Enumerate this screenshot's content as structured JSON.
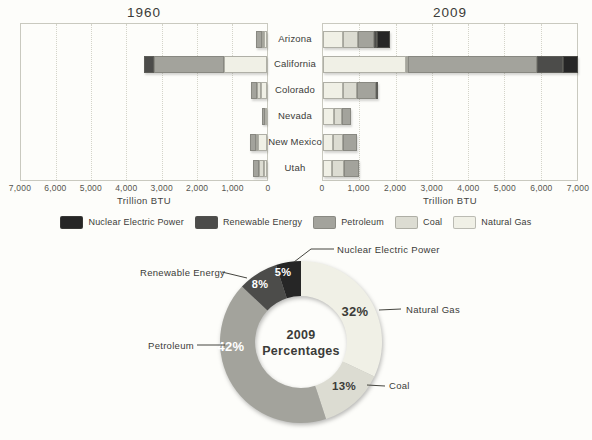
{
  "colors": {
    "Nuclear Electric Power": "#262626",
    "Renewable Energy": "#4c4c4a",
    "Petroleum": "#a3a39c",
    "Coal": "#dcdcd2",
    "Natural Gas": "#f0f0e6"
  },
  "bar_section": {
    "left_title": "1960",
    "right_title": "2009",
    "left_ticks": [
      "7,000",
      "6,000",
      "5,000",
      "4,000",
      "3,000",
      "2,000",
      "1,000",
      "0"
    ],
    "right_ticks": [
      "0",
      "1,000",
      "2,000",
      "3,000",
      "4,000",
      "5,000",
      "6,000",
      "7,000"
    ],
    "axis_label": "Trillion BTU",
    "states": [
      "Arizona",
      "California",
      "Colorado",
      "Nevada",
      "New Mexico",
      "Utah"
    ]
  },
  "legend": {
    "items": [
      {
        "label": "Nuclear Electric Power"
      },
      {
        "label": "Renewable Energy"
      },
      {
        "label": "Petroleum"
      },
      {
        "label": "Coal"
      },
      {
        "label": "Natural Gas"
      }
    ]
  },
  "donut": {
    "center_line1": "2009",
    "center_line2": "Percentages"
  },
  "chart_data": [
    {
      "type": "bar",
      "title": "1960",
      "orientation": "horizontal",
      "stacked": true,
      "axis_reversed": true,
      "categories": [
        "Arizona",
        "California",
        "Colorado",
        "Nevada",
        "New Mexico",
        "Utah"
      ],
      "series": [
        {
          "name": "Natural Gas",
          "values": [
            90,
            1230,
            170,
            40,
            270,
            100
          ]
        },
        {
          "name": "Coal",
          "values": [
            30,
            0,
            110,
            0,
            20,
            130
          ]
        },
        {
          "name": "Petroleum",
          "values": [
            170,
            2000,
            170,
            100,
            170,
            170
          ]
        },
        {
          "name": "Renewable Energy",
          "values": [
            0,
            260,
            0,
            0,
            0,
            0
          ]
        },
        {
          "name": "Nuclear Electric Power",
          "values": [
            0,
            0,
            0,
            0,
            0,
            0
          ]
        }
      ],
      "xlabel": "Trillion BTU",
      "xlim": [
        0,
        7000
      ],
      "grid": true
    },
    {
      "type": "bar",
      "title": "2009",
      "orientation": "horizontal",
      "stacked": true,
      "axis_reversed": false,
      "categories": [
        "Arizona",
        "California",
        "Colorado",
        "Nevada",
        "New Mexico",
        "Utah"
      ],
      "series": [
        {
          "name": "Natural Gas",
          "values": [
            540,
            2300,
            540,
            310,
            280,
            260
          ]
        },
        {
          "name": "Coal",
          "values": [
            430,
            50,
            390,
            210,
            260,
            320
          ]
        },
        {
          "name": "Petroleum",
          "values": [
            430,
            3550,
            530,
            250,
            400,
            400
          ]
        },
        {
          "name": "Renewable Energy",
          "values": [
            90,
            700,
            70,
            0,
            0,
            0
          ]
        },
        {
          "name": "Nuclear Electric Power",
          "values": [
            370,
            420,
            0,
            0,
            0,
            0
          ]
        }
      ],
      "xlabel": "Trillion BTU",
      "xlim": [
        0,
        7000
      ],
      "grid": true
    },
    {
      "type": "pie",
      "title": "2009 Percentages",
      "donut": true,
      "labels": [
        "Natural Gas",
        "Coal",
        "Petroleum",
        "Renewable Energy",
        "Nuclear Electric Power"
      ],
      "values": [
        32,
        13,
        42,
        8,
        5
      ],
      "value_labels": [
        "32%",
        "13%",
        "42%",
        "8%",
        "5%"
      ],
      "center_text": [
        "2009",
        "Percentages"
      ]
    }
  ]
}
